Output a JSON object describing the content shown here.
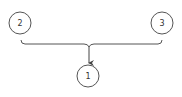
{
  "diagram": {
    "type": "merge-flow",
    "nodes": [
      {
        "id": "node-2",
        "label": "2",
        "cx": 20,
        "cy": 23,
        "r": 11
      },
      {
        "id": "node-3",
        "label": "3",
        "cx": 162,
        "cy": 23,
        "r": 11
      },
      {
        "id": "node-1",
        "label": "1",
        "cx": 88,
        "cy": 76,
        "r": 11
      }
    ],
    "edges": [
      {
        "from": "node-2",
        "to": "node-1",
        "style": "bracket-merge"
      },
      {
        "from": "node-3",
        "to": "node-1",
        "style": "bracket-merge"
      }
    ],
    "colors": {
      "stroke": "#555555",
      "text": "#333333",
      "background": "#ffffff"
    }
  }
}
